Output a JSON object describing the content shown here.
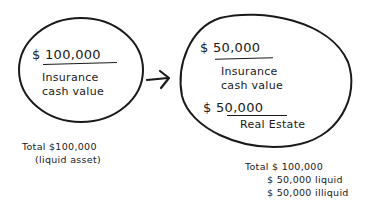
{
  "diagram": {
    "type": "before-after asset conversion",
    "left_bubble": {
      "amount": "$ 100,000",
      "label_line1": "Insurance",
      "label_line2": "cash value"
    },
    "arrow": "right-arrow",
    "right_bubble": {
      "item1_amount": "$ 50,000",
      "item1_label_line1": "Insurance",
      "item1_label_line2": "cash value",
      "item2_amount": "$ 50,000",
      "item2_label": "Real Estate"
    },
    "left_summary": {
      "line1": "Total $100,000",
      "line2": "(liquid asset)"
    },
    "right_summary": {
      "line1": "Total $ 100,000",
      "line2": "$ 50,000 liquid",
      "line3": "$ 50,000 illiquid"
    },
    "colors": {
      "ink": "#1a1a1a",
      "background": "#ffffff"
    }
  }
}
